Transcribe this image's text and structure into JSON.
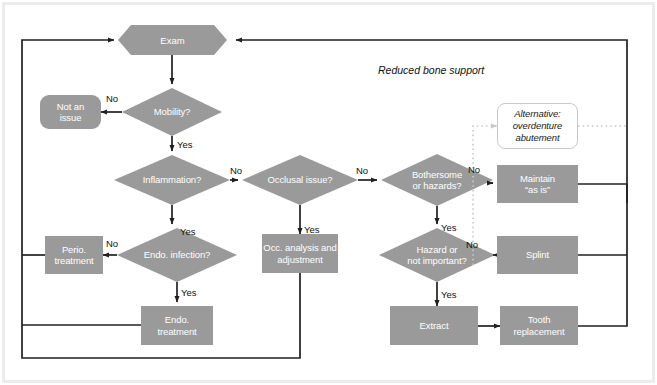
{
  "diagram": {
    "title_caption": "Reduced bone support",
    "fill_color": "#9a9a9a",
    "line_color": "#231f20",
    "text_color": "#ffffff",
    "dotted_color": "#c9c9c9",
    "nodes": {
      "exam": "Exam",
      "not_an_issue": "Not an\nissue",
      "mobility": "Mobility?",
      "inflammation": "Inflammation?",
      "occlusal_issue": "Occlusal issue?",
      "bothersome_or_hazards": "Bothersome\nor hazards?",
      "maintain_as_is": "Maintain\n“as is”",
      "alternative_overdenture": "Alternative:\noverdenture\nabutement",
      "perio_treatment": "Perio.\ntreatment",
      "endo_infection": "Endo. infection?",
      "occ_analysis": "Occ. analysis and\nadjustment",
      "hazard_or_not_important": "Hazard or\nnot important?",
      "splint": "Splint",
      "endo_treatment": "Endo.\ntreatment",
      "extract": "Extract",
      "tooth_replacement": "Tooth\nreplacement"
    },
    "edge_labels": {
      "mobility_no": "No",
      "mobility_yes": "Yes",
      "inflammation_no": "No",
      "inflammation_yes": "Yes",
      "occlusal_no": "No",
      "occlusal_yes": "Yes",
      "bothersome_no": "No",
      "bothersome_yes": "Yes",
      "endo_no": "No",
      "endo_yes": "Yes",
      "hazard_no": "No",
      "hazard_yes": "Yes"
    }
  }
}
